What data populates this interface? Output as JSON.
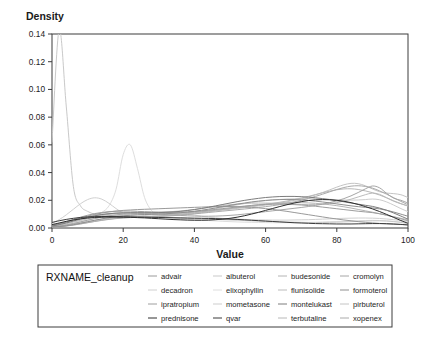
{
  "chart_data": {
    "type": "line",
    "title": "",
    "xlabel": "Value",
    "ylabel": "Density",
    "ylabel_position": "top-left",
    "xlim": [
      0,
      100
    ],
    "ylim": [
      0,
      0.14
    ],
    "x_ticks": [
      0,
      20,
      40,
      60,
      80,
      100
    ],
    "x_tick_labels": [
      "0",
      "20",
      "40",
      "60",
      "80",
      "100"
    ],
    "y_ticks": [
      0.0,
      0.02,
      0.04,
      0.06,
      0.08,
      0.1,
      0.12,
      0.14
    ],
    "y_tick_labels": [
      "0.00",
      "0.02",
      "0.04",
      "0.06",
      "0.08",
      "0.10",
      "0.12",
      "0.14"
    ],
    "grid": false,
    "legend_position": "bottom",
    "legend_title": "RXNAME_cleanup",
    "legend_columns": 4,
    "x_sample": [
      0,
      2,
      4,
      6,
      8,
      10,
      12,
      14,
      16,
      18,
      20,
      22,
      24,
      26,
      28,
      30,
      32,
      34,
      36,
      38,
      40,
      42,
      44,
      46,
      48,
      50,
      52,
      54,
      56,
      58,
      60,
      62,
      64,
      66,
      68,
      70,
      72,
      74,
      76,
      78,
      80,
      82,
      84,
      86,
      88,
      90,
      92,
      94,
      96,
      98,
      100
    ],
    "series": [
      {
        "name": "advair",
        "color": "#9a9a9a",
        "values": [
          0.0015,
          0.0028,
          0.0042,
          0.0058,
          0.0072,
          0.0086,
          0.0098,
          0.0108,
          0.0116,
          0.0122,
          0.0127,
          0.013,
          0.0133,
          0.0135,
          0.0137,
          0.0139,
          0.0141,
          0.0143,
          0.0145,
          0.0147,
          0.0149,
          0.0151,
          0.0153,
          0.0154,
          0.0155,
          0.0155,
          0.0154,
          0.0152,
          0.0149,
          0.0145,
          0.014,
          0.0134,
          0.0127,
          0.012,
          0.0112,
          0.0104,
          0.0096,
          0.0088,
          0.008,
          0.0072,
          0.0065,
          0.0058,
          0.0052,
          0.0046,
          0.0041,
          0.0037,
          0.0033,
          0.003,
          0.0027,
          0.0025,
          0.0023
        ]
      },
      {
        "name": "albuterol",
        "color": "#c9c9c9",
        "values": [
          0.062,
          0.143,
          0.088,
          0.03,
          0.016,
          0.012,
          0.01,
          0.0095,
          0.0092,
          0.009,
          0.0088,
          0.0086,
          0.0084,
          0.0082,
          0.008,
          0.0078,
          0.0076,
          0.0074,
          0.0072,
          0.007,
          0.0068,
          0.0066,
          0.0064,
          0.0062,
          0.006,
          0.0058,
          0.0056,
          0.0054,
          0.0052,
          0.005,
          0.0048,
          0.0046,
          0.0044,
          0.0043,
          0.0042,
          0.0041,
          0.004,
          0.004,
          0.004,
          0.0041,
          0.0042,
          0.0044,
          0.0046,
          0.0048,
          0.005,
          0.0052,
          0.0052,
          0.005,
          0.0046,
          0.004,
          0.0032
        ]
      },
      {
        "name": "budesonide",
        "color": "#b4b4b4",
        "values": [
          0.002,
          0.003,
          0.0042,
          0.0055,
          0.0068,
          0.008,
          0.009,
          0.0098,
          0.0104,
          0.0108,
          0.011,
          0.0111,
          0.0111,
          0.011,
          0.0109,
          0.0108,
          0.0107,
          0.0107,
          0.0108,
          0.011,
          0.0113,
          0.0117,
          0.0122,
          0.0128,
          0.0134,
          0.0141,
          0.0148,
          0.0155,
          0.0162,
          0.0168,
          0.0173,
          0.0177,
          0.018,
          0.0182,
          0.0183,
          0.0183,
          0.0181,
          0.0178,
          0.0174,
          0.0168,
          0.0161,
          0.0153,
          0.0144,
          0.0134,
          0.0124,
          0.0114,
          0.0103,
          0.0092,
          0.0081,
          0.007,
          0.006
        ]
      },
      {
        "name": "cromolyn",
        "color": "#a6a6a6",
        "values": [
          0.0008,
          0.0014,
          0.0022,
          0.0032,
          0.0044,
          0.0056,
          0.0068,
          0.0079,
          0.0088,
          0.0095,
          0.01,
          0.0103,
          0.0104,
          0.0104,
          0.0102,
          0.01,
          0.0097,
          0.0094,
          0.0091,
          0.0088,
          0.0086,
          0.0085,
          0.0085,
          0.0086,
          0.0088,
          0.0091,
          0.0095,
          0.01,
          0.0106,
          0.0112,
          0.0118,
          0.0124,
          0.013,
          0.0136,
          0.0142,
          0.0148,
          0.0155,
          0.0163,
          0.0172,
          0.0183,
          0.0196,
          0.0212,
          0.0232,
          0.0256,
          0.0282,
          0.0303,
          0.029,
          0.025,
          0.0215,
          0.02,
          0.018
        ]
      },
      {
        "name": "decadron",
        "color": "#d0d0d0",
        "values": [
          0.0035,
          0.006,
          0.0095,
          0.0135,
          0.0175,
          0.0205,
          0.0218,
          0.0208,
          0.0178,
          0.014,
          0.0108,
          0.009,
          0.0085,
          0.009,
          0.01,
          0.011,
          0.0115,
          0.0115,
          0.011,
          0.0102,
          0.0093,
          0.0085,
          0.0078,
          0.0073,
          0.0069,
          0.0066,
          0.0064,
          0.0062,
          0.006,
          0.0059,
          0.0058,
          0.0057,
          0.0057,
          0.0057,
          0.0058,
          0.0059,
          0.006,
          0.0062,
          0.0064,
          0.0066,
          0.0068,
          0.007,
          0.0071,
          0.0072,
          0.0072,
          0.0071,
          0.0069,
          0.0065,
          0.006,
          0.0054,
          0.0048
        ]
      },
      {
        "name": "elixophyllin",
        "color": "#dedede",
        "values": [
          0.003,
          0.0035,
          0.004,
          0.0046,
          0.0054,
          0.0066,
          0.0084,
          0.0112,
          0.016,
          0.028,
          0.053,
          0.06,
          0.043,
          0.022,
          0.0125,
          0.009,
          0.0078,
          0.0072,
          0.0068,
          0.0064,
          0.006,
          0.0057,
          0.0054,
          0.0051,
          0.0048,
          0.0046,
          0.0044,
          0.0042,
          0.0041,
          0.004,
          0.0039,
          0.0038,
          0.0038,
          0.0038,
          0.0038,
          0.0039,
          0.004,
          0.0041,
          0.0043,
          0.0045,
          0.0047,
          0.0049,
          0.0051,
          0.0053,
          0.0054,
          0.0055,
          0.0054,
          0.0052,
          0.0048,
          0.0043,
          0.0038
        ]
      },
      {
        "name": "flunisolide",
        "color": "#bcbcbc",
        "values": [
          0.0012,
          0.002,
          0.003,
          0.0042,
          0.0055,
          0.0068,
          0.008,
          0.009,
          0.0098,
          0.0104,
          0.0108,
          0.011,
          0.0111,
          0.0112,
          0.0113,
          0.0114,
          0.0116,
          0.0119,
          0.0123,
          0.0128,
          0.0134,
          0.0141,
          0.0148,
          0.0155,
          0.0162,
          0.0168,
          0.0173,
          0.0177,
          0.0179,
          0.018,
          0.018,
          0.0179,
          0.0177,
          0.0175,
          0.0172,
          0.017,
          0.0169,
          0.0169,
          0.0171,
          0.0176,
          0.0183,
          0.0194,
          0.0208,
          0.0224,
          0.024,
          0.0252,
          0.0243,
          0.0218,
          0.0193,
          0.0175,
          0.016
        ]
      },
      {
        "name": "formoterol",
        "color": "#8f8f8f",
        "values": [
          0.0006,
          0.001,
          0.0016,
          0.0024,
          0.0034,
          0.0045,
          0.0056,
          0.0066,
          0.0075,
          0.0082,
          0.0088,
          0.0092,
          0.0095,
          0.0097,
          0.0099,
          0.0101,
          0.0103,
          0.0106,
          0.011,
          0.0115,
          0.0121,
          0.0128,
          0.0136,
          0.0145,
          0.0154,
          0.0163,
          0.0172,
          0.018,
          0.0188,
          0.0194,
          0.0199,
          0.0203,
          0.0205,
          0.0206,
          0.0205,
          0.0203,
          0.0199,
          0.0194,
          0.0188,
          0.0181,
          0.0174,
          0.0167,
          0.016,
          0.0154,
          0.0149,
          0.0145,
          0.0138,
          0.0128,
          0.0115,
          0.01,
          0.0085
        ]
      },
      {
        "name": "ipratropium",
        "color": "#9e9e9e",
        "values": [
          0.0018,
          0.003,
          0.0045,
          0.0062,
          0.0078,
          0.0092,
          0.0104,
          0.0112,
          0.0118,
          0.0121,
          0.0122,
          0.0122,
          0.012,
          0.0118,
          0.0116,
          0.0114,
          0.0113,
          0.0113,
          0.0114,
          0.0116,
          0.0119,
          0.0123,
          0.0128,
          0.0134,
          0.014,
          0.0146,
          0.0152,
          0.0158,
          0.0163,
          0.0167,
          0.017,
          0.0172,
          0.0172,
          0.0171,
          0.0169,
          0.0166,
          0.0162,
          0.0157,
          0.0151,
          0.0145,
          0.0139,
          0.0133,
          0.0127,
          0.0121,
          0.0116,
          0.0111,
          0.0103,
          0.0093,
          0.008,
          0.0066,
          0.0052
        ]
      },
      {
        "name": "mometasone",
        "color": "#cdcdcd",
        "values": [
          0.001,
          0.0016,
          0.0024,
          0.0034,
          0.0045,
          0.0057,
          0.0068,
          0.0078,
          0.0086,
          0.0092,
          0.0096,
          0.0098,
          0.0099,
          0.0099,
          0.0099,
          0.0099,
          0.01,
          0.0102,
          0.0105,
          0.011,
          0.0116,
          0.0123,
          0.0131,
          0.014,
          0.0149,
          0.0158,
          0.0167,
          0.0176,
          0.0184,
          0.0191,
          0.0197,
          0.0202,
          0.0206,
          0.0209,
          0.0211,
          0.0212,
          0.0212,
          0.0211,
          0.0209,
          0.0207,
          0.0204,
          0.0202,
          0.0201,
          0.0202,
          0.0205,
          0.0209,
          0.0204,
          0.0188,
          0.0165,
          0.014,
          0.0118
        ]
      },
      {
        "name": "montelukast",
        "color": "#7d7d7d",
        "values": [
          0.0014,
          0.0024,
          0.0036,
          0.005,
          0.0064,
          0.0077,
          0.0088,
          0.0097,
          0.0103,
          0.0107,
          0.0109,
          0.011,
          0.011,
          0.011,
          0.011,
          0.0111,
          0.0113,
          0.0116,
          0.012,
          0.0126,
          0.0133,
          0.0141,
          0.015,
          0.016,
          0.017,
          0.018,
          0.019,
          0.0199,
          0.0207,
          0.0214,
          0.022,
          0.0224,
          0.0227,
          0.0228,
          0.0228,
          0.0226,
          0.0223,
          0.0218,
          0.0212,
          0.0205,
          0.0197,
          0.0189,
          0.018,
          0.0172,
          0.0164,
          0.0156,
          0.0144,
          0.0128,
          0.0108,
          0.0086,
          0.0064
        ]
      },
      {
        "name": "pirbuterol",
        "color": "#c4c4c4",
        "values": [
          0.0006,
          0.001,
          0.0015,
          0.0022,
          0.003,
          0.0039,
          0.0048,
          0.0057,
          0.0064,
          0.007,
          0.0074,
          0.0077,
          0.0079,
          0.0081,
          0.0083,
          0.0085,
          0.0088,
          0.0091,
          0.0095,
          0.01,
          0.0105,
          0.0111,
          0.0117,
          0.0123,
          0.0129,
          0.0135,
          0.0141,
          0.0147,
          0.0153,
          0.0159,
          0.0165,
          0.0172,
          0.018,
          0.0189,
          0.0199,
          0.0211,
          0.0224,
          0.0239,
          0.0256,
          0.0275,
          0.0295,
          0.0312,
          0.0322,
          0.032,
          0.0305,
          0.0282,
          0.0262,
          0.0252,
          0.0248,
          0.024,
          0.022
        ]
      },
      {
        "name": "prednisone",
        "color": "#2e2e2e",
        "values": [
          0.0024,
          0.0036,
          0.0048,
          0.0058,
          0.0066,
          0.0072,
          0.0076,
          0.0078,
          0.0079,
          0.0079,
          0.0078,
          0.0077,
          0.0075,
          0.0073,
          0.007,
          0.0067,
          0.0064,
          0.0061,
          0.0059,
          0.0057,
          0.0056,
          0.0056,
          0.0057,
          0.006,
          0.0064,
          0.007,
          0.0078,
          0.0088,
          0.01,
          0.0113,
          0.0127,
          0.0141,
          0.0155,
          0.0168,
          0.018,
          0.019,
          0.0198,
          0.0203,
          0.0205,
          0.0204,
          0.02,
          0.0193,
          0.0183,
          0.017,
          0.0155,
          0.0138,
          0.0119,
          0.0098,
          0.0076,
          0.0054,
          0.0034
        ]
      },
      {
        "name": "qvar",
        "color": "#3a3a3a",
        "values": [
          0.004,
          0.0052,
          0.0062,
          0.007,
          0.0076,
          0.008,
          0.0082,
          0.0083,
          0.0083,
          0.0082,
          0.0081,
          0.008,
          0.0079,
          0.0078,
          0.0077,
          0.0076,
          0.0075,
          0.0074,
          0.0073,
          0.0072,
          0.0071,
          0.007,
          0.0069,
          0.0068,
          0.0066,
          0.0064,
          0.0062,
          0.0059,
          0.0056,
          0.0053,
          0.005,
          0.0047,
          0.0044,
          0.0041,
          0.0038,
          0.0036,
          0.0034,
          0.0032,
          0.0031,
          0.003,
          0.0029,
          0.0029,
          0.0029,
          0.003,
          0.0031,
          0.0032,
          0.0032,
          0.0031,
          0.0029,
          0.0026,
          0.0022
        ]
      },
      {
        "name": "terbutaline",
        "color": "#b8b8b8",
        "values": [
          0.0008,
          0.0013,
          0.002,
          0.0028,
          0.0037,
          0.0046,
          0.0055,
          0.0063,
          0.0069,
          0.0074,
          0.0078,
          0.008,
          0.0082,
          0.0084,
          0.0086,
          0.0088,
          0.0091,
          0.0095,
          0.0099,
          0.0104,
          0.011,
          0.0116,
          0.0122,
          0.0128,
          0.0134,
          0.014,
          0.0146,
          0.0152,
          0.0158,
          0.0164,
          0.0171,
          0.0178,
          0.0186,
          0.0195,
          0.0205,
          0.0216,
          0.0228,
          0.0241,
          0.0254,
          0.0266,
          0.0276,
          0.0282,
          0.0283,
          0.0278,
          0.0268,
          0.0255,
          0.0238,
          0.0218,
          0.0196,
          0.0176,
          0.0158
        ]
      },
      {
        "name": "xopenex",
        "color": "#aaaaaa",
        "values": [
          0.0005,
          0.0009,
          0.0014,
          0.0021,
          0.0029,
          0.0038,
          0.0047,
          0.0055,
          0.0062,
          0.0068,
          0.0072,
          0.0075,
          0.0077,
          0.0079,
          0.0081,
          0.0083,
          0.0086,
          0.0089,
          0.0093,
          0.0097,
          0.0102,
          0.0107,
          0.0112,
          0.0117,
          0.0122,
          0.0127,
          0.0132,
          0.0137,
          0.0142,
          0.0148,
          0.0154,
          0.0161,
          0.0169,
          0.0178,
          0.0188,
          0.02,
          0.0213,
          0.0228,
          0.0244,
          0.0261,
          0.0278,
          0.0292,
          0.0302,
          0.0305,
          0.03,
          0.0288,
          0.0268,
          0.0244,
          0.0218,
          0.0192,
          0.0168
        ]
      }
    ]
  },
  "legend": {
    "title": "RXNAME_cleanup",
    "columns": [
      [
        "advair",
        "decadron",
        "ipratropium",
        "prednisone"
      ],
      [
        "albuterol",
        "elixophyllin",
        "mometasone",
        "qvar"
      ],
      [
        "budesonide",
        "flunisolide",
        "montelukast",
        "terbutaline"
      ],
      [
        "cromolyn",
        "formoterol",
        "pirbuterol",
        "xopenex"
      ]
    ]
  }
}
